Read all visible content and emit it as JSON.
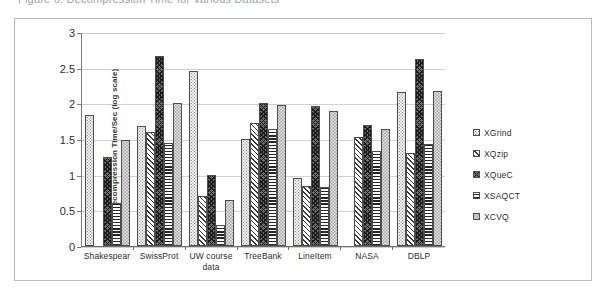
{
  "figure": {
    "caption": "Figure 6. Decompression Time for Various Datasets"
  },
  "chart_data": {
    "type": "bar",
    "title": "",
    "xlabel": "",
    "ylabel": "Decompression Time/Sec (log scale)",
    "ylim": [
      0,
      3
    ],
    "yticks": [
      "0",
      "0.5",
      "1",
      "1.5",
      "2",
      "2.5",
      "3"
    ],
    "ytick_values": [
      0,
      0.5,
      1,
      1.5,
      2,
      2.5,
      3
    ],
    "grid": true,
    "legend_position": "right",
    "categories": [
      "Shakespear",
      "SwissProt",
      "UW course data",
      "TreeBank",
      "LineItem",
      "NASA",
      "DBLP"
    ],
    "series": [
      {
        "name": "XGrind",
        "pattern": "pat-xgrind",
        "values": [
          1.85,
          1.69,
          2.47,
          1.51,
          0.96,
          0.0,
          2.17
        ]
      },
      {
        "name": "XQzip",
        "pattern": "pat-xqzip",
        "values": [
          0.0,
          1.6,
          0.7,
          1.73,
          0.84,
          1.53,
          1.31
        ]
      },
      {
        "name": "XQueC",
        "pattern": "pat-xquec",
        "values": [
          1.25,
          2.68,
          1.0,
          2.02,
          1.97,
          1.71,
          2.64
        ]
      },
      {
        "name": "XSAQCT",
        "pattern": "pat-xsaqct",
        "values": [
          0.6,
          1.45,
          0.3,
          1.65,
          0.83,
          1.34,
          1.43
        ]
      },
      {
        "name": "XCVQ",
        "pattern": "pat-xcvq",
        "values": [
          1.5,
          2.01,
          0.65,
          1.99,
          1.9,
          1.65,
          2.19
        ]
      }
    ]
  }
}
